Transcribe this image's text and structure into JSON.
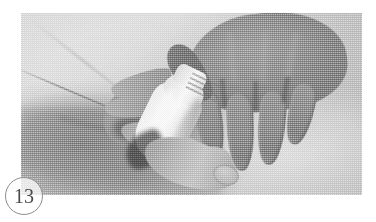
{
  "page": {
    "background_color": "#ffffff",
    "width": 376,
    "height": 222
  },
  "figure": {
    "number_label": "13",
    "number_badge_shape": "circle",
    "number_text_color": "#4a4a4a",
    "badge_border_color": "#8e8e8e",
    "photo": {
      "type": "halftone-grayscale-photograph",
      "alt_description": "Two hands holding a white ribbed-neck bottle over a light draped cloth",
      "frame": {
        "left": 21,
        "top": 13,
        "width": 341,
        "height": 182
      },
      "tone_range": {
        "darkest": "#5e5e5e",
        "midtone": "#9a9a9a",
        "lightest": "#ffffff"
      },
      "elements": [
        {
          "name": "draped-cloth",
          "region": "upper-left",
          "tone": "#e2e2e2"
        },
        {
          "name": "supporting-forearm",
          "region": "lower-left",
          "tone": "#868686"
        },
        {
          "name": "left-hand-grip",
          "region": "center-left",
          "tone": "#a6a6a6"
        },
        {
          "name": "white-bottle",
          "region": "center",
          "tone": "#fbfbfb"
        },
        {
          "name": "right-hand-spread-fingers",
          "region": "right",
          "tone": "#8c8c8c"
        },
        {
          "name": "extended-finger",
          "region": "lower-center",
          "tone": "#b6b6b6"
        }
      ]
    }
  }
}
